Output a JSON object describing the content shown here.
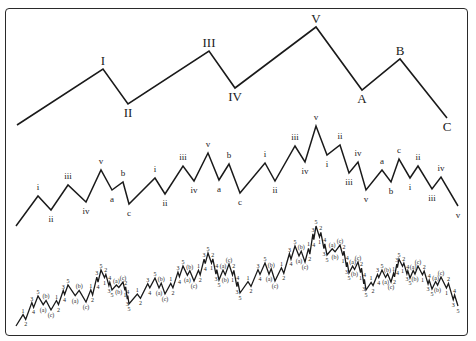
{
  "colors": {
    "line": "#1a1a1a",
    "label": "#222222",
    "border": "#2a2a2a",
    "background": "#ffffff"
  },
  "degree_primary": {
    "points": [
      {
        "x": 17,
        "y": 125,
        "label": ""
      },
      {
        "x": 103,
        "y": 69,
        "label": "I",
        "pos": "above"
      },
      {
        "x": 128,
        "y": 104,
        "label": "II",
        "pos": "below"
      },
      {
        "x": 209,
        "y": 51,
        "label": "III",
        "pos": "above"
      },
      {
        "x": 235,
        "y": 88,
        "label": "IV",
        "pos": "below"
      },
      {
        "x": 316,
        "y": 27,
        "label": "V",
        "pos": "above"
      },
      {
        "x": 362,
        "y": 90,
        "label": "A",
        "pos": "below"
      },
      {
        "x": 400,
        "y": 59,
        "label": "B",
        "pos": "above"
      },
      {
        "x": 447,
        "y": 118,
        "label": "C",
        "pos": "below"
      }
    ]
  },
  "degree_intermediate": {
    "points": [
      {
        "x": 16,
        "y": 226,
        "label": ""
      },
      {
        "x": 38,
        "y": 196,
        "label": "i",
        "pos": "above"
      },
      {
        "x": 51,
        "y": 210,
        "label": "ii",
        "pos": "below"
      },
      {
        "x": 68,
        "y": 185,
        "label": "iii",
        "pos": "above"
      },
      {
        "x": 86,
        "y": 202,
        "label": "iv",
        "pos": "below"
      },
      {
        "x": 101,
        "y": 170,
        "label": "v",
        "pos": "above"
      },
      {
        "x": 112,
        "y": 190,
        "label": "a",
        "pos": "below"
      },
      {
        "x": 123,
        "y": 182,
        "label": "b",
        "pos": "above"
      },
      {
        "x": 129,
        "y": 204,
        "label": "c",
        "pos": "below"
      },
      {
        "x": 155,
        "y": 178,
        "label": "i",
        "pos": "above"
      },
      {
        "x": 165,
        "y": 194,
        "label": "ii",
        "pos": "below"
      },
      {
        "x": 183,
        "y": 166,
        "label": "iii",
        "pos": "above"
      },
      {
        "x": 194,
        "y": 181,
        "label": "iv",
        "pos": "below"
      },
      {
        "x": 208,
        "y": 153,
        "label": "v",
        "pos": "above"
      },
      {
        "x": 219,
        "y": 180,
        "label": "a",
        "pos": "below"
      },
      {
        "x": 229,
        "y": 164,
        "label": "b",
        "pos": "above"
      },
      {
        "x": 240,
        "y": 193,
        "label": "c",
        "pos": "below"
      },
      {
        "x": 265,
        "y": 163,
        "label": "i",
        "pos": "above"
      },
      {
        "x": 275,
        "y": 181,
        "label": "ii",
        "pos": "below"
      },
      {
        "x": 295,
        "y": 146,
        "label": "iii",
        "pos": "above"
      },
      {
        "x": 305,
        "y": 162,
        "label": "iv",
        "pos": "below"
      },
      {
        "x": 316,
        "y": 126,
        "label": "v",
        "pos": "above"
      },
      {
        "x": 327,
        "y": 155,
        "label": "i",
        "pos": "below"
      },
      {
        "x": 340,
        "y": 145,
        "label": "ii",
        "pos": "above"
      },
      {
        "x": 349,
        "y": 173,
        "label": "iii",
        "pos": "below"
      },
      {
        "x": 358,
        "y": 162,
        "label": "iv",
        "pos": "above"
      },
      {
        "x": 366,
        "y": 190,
        "label": "v",
        "pos": "below"
      },
      {
        "x": 382,
        "y": 170,
        "label": "a",
        "pos": "above"
      },
      {
        "x": 391,
        "y": 182,
        "label": "b",
        "pos": "below"
      },
      {
        "x": 399,
        "y": 159,
        "label": "c",
        "pos": "above"
      },
      {
        "x": 410,
        "y": 178,
        "label": "i",
        "pos": "below"
      },
      {
        "x": 418,
        "y": 166,
        "label": "ii",
        "pos": "above"
      },
      {
        "x": 432,
        "y": 189,
        "label": "iii",
        "pos": "below"
      },
      {
        "x": 441,
        "y": 177,
        "label": "iv",
        "pos": "above"
      },
      {
        "x": 458,
        "y": 206,
        "label": "v",
        "pos": "below"
      }
    ]
  },
  "degree_minor": {
    "y_offset": 100,
    "impulse_labels": [
      "1",
      "2",
      "3",
      "4",
      "5"
    ],
    "corrective_labels": [
      "(a)",
      "(b)",
      "(c)"
    ]
  }
}
